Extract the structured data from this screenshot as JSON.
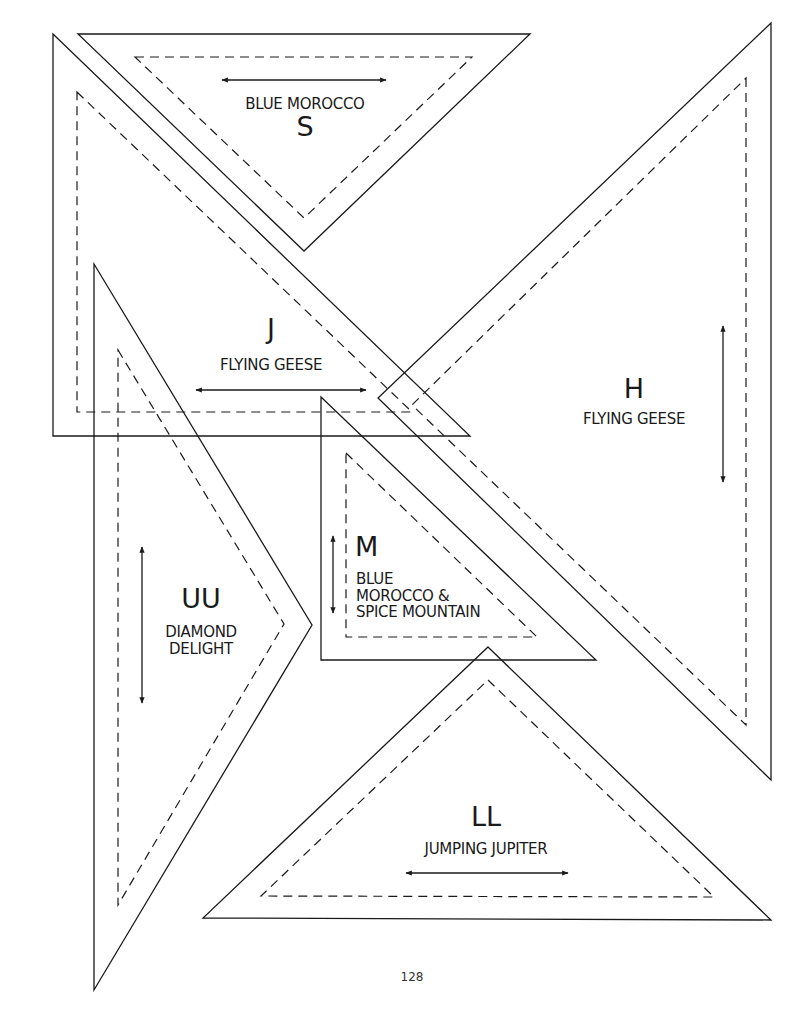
{
  "page": {
    "number": "128",
    "ink_color": "#1a1a1a",
    "background": "#ffffff"
  },
  "templates": [
    {
      "id": "S",
      "code": "S",
      "name": "BLUE MOROCCO",
      "outer": [
        [
          78,
          34
        ],
        [
          530,
          34
        ],
        [
          304,
          251
        ]
      ],
      "inner": [
        [
          135,
          57
        ],
        [
          472,
          57
        ],
        [
          304,
          218
        ]
      ],
      "arrow": {
        "x1": 222,
        "y1": 80,
        "x2": 386,
        "y2": 80
      },
      "code_pos": {
        "x": 305,
        "y": 116
      },
      "name_pos": {
        "x": 305,
        "y": 96
      }
    },
    {
      "id": "J",
      "code": "J",
      "name": "FLYING GEESE",
      "outer": [
        [
          53,
          34
        ],
        [
          470,
          436
        ],
        [
          53,
          436
        ]
      ],
      "inner": [
        [
          77,
          92
        ],
        [
          412,
          412
        ],
        [
          77,
          412
        ]
      ],
      "arrow": {
        "x1": 196,
        "y1": 390,
        "x2": 366,
        "y2": 390
      },
      "code_pos": {
        "x": 271,
        "y": 318
      },
      "name_pos": {
        "x": 271,
        "y": 357
      }
    },
    {
      "id": "H",
      "code": "H",
      "name": "FLYING GEESE",
      "outer": [
        [
          771,
          23
        ],
        [
          771,
          780
        ],
        [
          378,
          398
        ]
      ],
      "inner": [
        [
          746,
          78
        ],
        [
          746,
          725
        ],
        [
          412,
          405
        ]
      ],
      "arrow": {
        "x1": 723,
        "y1": 326,
        "x2": 723,
        "y2": 482
      },
      "code_pos": {
        "x": 634,
        "y": 378
      },
      "name_pos": {
        "x": 634,
        "y": 411
      }
    },
    {
      "id": "UU",
      "code": "UU",
      "name": "DIAMOND\nDELIGHT",
      "outer": [
        [
          94,
          264
        ],
        [
          312,
          625
        ],
        [
          94,
          990
        ]
      ],
      "inner": [
        [
          118,
          350
        ],
        [
          284,
          624
        ],
        [
          118,
          905
        ]
      ],
      "arrow": {
        "x1": 142,
        "y1": 547,
        "x2": 142,
        "y2": 703
      },
      "code_pos": {
        "x": 201,
        "y": 588
      },
      "name_pos": {
        "x": 201,
        "y": 624
      }
    },
    {
      "id": "M",
      "code": "M",
      "name": "BLUE\nMOROCCO &\nSPICE MOUNTAIN",
      "outer": [
        [
          321,
          397
        ],
        [
          596,
          660
        ],
        [
          321,
          660
        ]
      ],
      "inner": [
        [
          346,
          453
        ],
        [
          537,
          637
        ],
        [
          346,
          637
        ]
      ],
      "arrow": {
        "x1": 333,
        "y1": 536,
        "x2": 333,
        "y2": 613
      },
      "code_pos": {
        "x": 355,
        "y": 536
      },
      "name_pos": {
        "x": 356,
        "y": 571
      }
    },
    {
      "id": "LL",
      "code": "LL",
      "name": "JUMPING JUPITER",
      "outer": [
        [
          488,
          647
        ],
        [
          771,
          920
        ],
        [
          203,
          918
        ]
      ],
      "inner": [
        [
          488,
          680
        ],
        [
          714,
          897
        ],
        [
          261,
          896
        ]
      ],
      "arrow": {
        "x1": 406,
        "y1": 873,
        "x2": 568,
        "y2": 873
      },
      "code_pos": {
        "x": 486,
        "y": 806
      },
      "name_pos": {
        "x": 486,
        "y": 841
      }
    }
  ]
}
